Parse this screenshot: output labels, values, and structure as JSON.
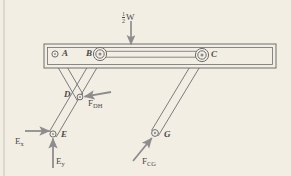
{
  "figure": {
    "background_color": "#f2eee4",
    "line_color": "#6e6e6e",
    "label_color": "#4a4a4a",
    "arrow_color": "#8a8a8a"
  },
  "joints": [
    {
      "id": "A",
      "label": "A",
      "x": 55,
      "y": 54,
      "label_x": 62,
      "label_y": 49
    },
    {
      "id": "B",
      "label": "B",
      "x": 100,
      "y": 54,
      "label_x": 86,
      "label_y": 49
    },
    {
      "id": "C",
      "label": "C",
      "x": 202,
      "y": 55,
      "label_x": 211,
      "label_y": 50
    },
    {
      "id": "D",
      "label": "D",
      "x": 80,
      "y": 97,
      "label_x": 64,
      "label_y": 90
    },
    {
      "id": "E",
      "label": "E",
      "x": 53,
      "y": 134,
      "label_x": 61,
      "label_y": 130
    },
    {
      "id": "G",
      "label": "G",
      "x": 155,
      "y": 133,
      "label_x": 164,
      "label_y": 130
    }
  ],
  "members": [
    {
      "from": "A",
      "to": "D",
      "name": "member-AD"
    },
    {
      "from": "B",
      "to": "E",
      "name": "member-BE"
    },
    {
      "from": "C",
      "to": "G",
      "name": "member-CG"
    }
  ],
  "beam": {
    "name": "horizontal-beam",
    "x": 44,
    "y": 44,
    "width": 232,
    "height": 24,
    "tie_bar": {
      "from": "B",
      "to": "C"
    }
  },
  "forces": [
    {
      "id": "half-W",
      "label_parts": {
        "numerator": "1",
        "denominator": "2",
        "symbol": "W"
      },
      "label_text": "1/2 W",
      "label_x": 122,
      "label_y": 11,
      "arrow": {
        "x1": 131,
        "y1": 21,
        "x2": 131,
        "y2": 44
      },
      "direction": "down"
    },
    {
      "id": "F_DH",
      "symbol": "F",
      "subscript": "DH",
      "label_x": 88,
      "label_y": 99,
      "arrow": {
        "x1": 111,
        "y1": 92,
        "x2": 84,
        "y2": 97
      },
      "direction": "up-left"
    },
    {
      "id": "E_x",
      "symbol": "E",
      "subscript": "x",
      "label_x": 15,
      "label_y": 137,
      "arrow": {
        "x1": 25,
        "y1": 131,
        "x2": 50,
        "y2": 131
      },
      "direction": "right"
    },
    {
      "id": "E_y",
      "symbol": "E",
      "subscript": "y",
      "label_x": 56,
      "label_y": 157,
      "arrow": {
        "x1": 53,
        "y1": 168,
        "x2": 53,
        "y2": 138
      },
      "direction": "up"
    },
    {
      "id": "F_CG",
      "symbol": "F",
      "subscript": "CG",
      "label_x": 142,
      "label_y": 157,
      "arrow": {
        "x1": 133,
        "y1": 160,
        "x2": 152,
        "y2": 138
      },
      "direction": "up-right"
    }
  ]
}
